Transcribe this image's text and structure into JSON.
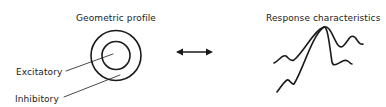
{
  "left_panel": {
    "title": "Geometric profile",
    "labels": {
      "excitatory": "Excitatory",
      "inhibitory": "Inhibitory"
    }
  },
  "right_panel": {
    "title": "Response characteristics"
  },
  "connector": {
    "type": "double-headed-arrow"
  },
  "colors": {
    "stroke": "#1a1a1a",
    "text": "#222222",
    "background": "#ffffff"
  }
}
